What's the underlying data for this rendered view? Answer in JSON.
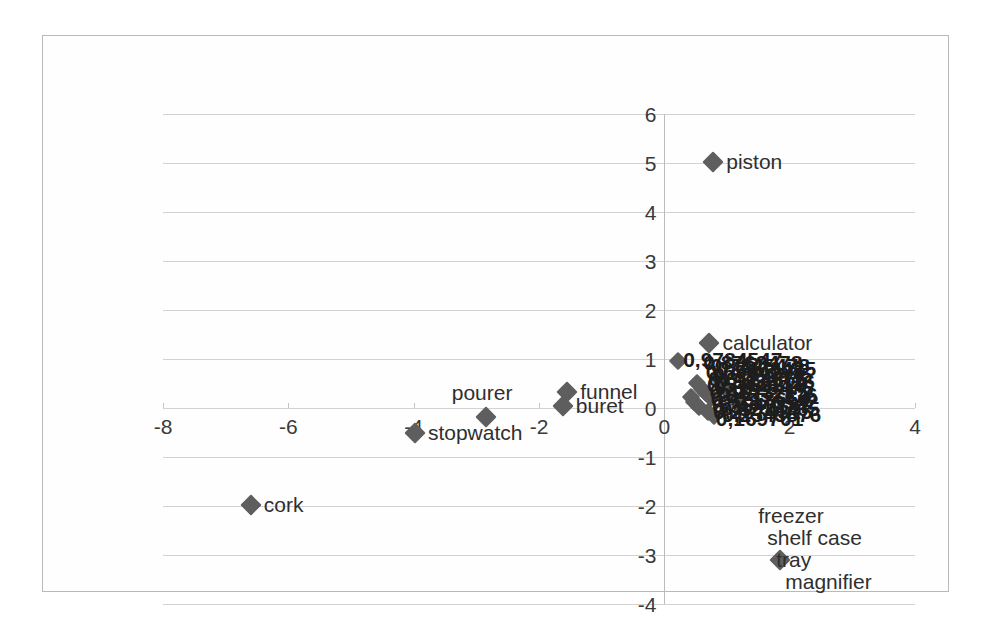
{
  "chart_data": {
    "type": "scatter",
    "title": "",
    "xlabel": "",
    "ylabel": "",
    "xlim": [
      -8,
      4
    ],
    "ylim": [
      -4,
      6
    ],
    "xticks": [
      "-8",
      "-6",
      "-4",
      "-2",
      "0",
      "2",
      "4"
    ],
    "yticks": [
      "6",
      "5",
      "4",
      "3",
      "2",
      "1",
      "0",
      "-1",
      "-2",
      "-3",
      "-4"
    ],
    "grid": "horizontal",
    "legend": "none",
    "marker": "diamond",
    "marker_color": "#5e5e5e",
    "decimal_separator": ",",
    "points": [
      {
        "label": "piston",
        "x": 0.78,
        "y": 5.02,
        "label_pos": "right"
      },
      {
        "label": "calculator",
        "x": 0.72,
        "y": 1.32,
        "label_pos": "right"
      },
      {
        "label": "cork",
        "x": -6.6,
        "y": -1.98,
        "label_pos": "right"
      },
      {
        "label": "stopwatch",
        "x": -3.98,
        "y": -0.52,
        "label_pos": "right"
      },
      {
        "label": "pourer",
        "x": -2.85,
        "y": -0.18,
        "label_pos": "above"
      },
      {
        "label": "funnel",
        "x": -1.55,
        "y": 0.33,
        "label_pos": "right"
      },
      {
        "label": "buret",
        "x": -1.62,
        "y": 0.04,
        "label_pos": "right"
      },
      {
        "label": "freezer",
        "x": 1.85,
        "y": -3.1,
        "label_pos": "stack-0"
      },
      {
        "label": "shelf case",
        "x": 1.85,
        "y": -3.1,
        "label_pos": "stack-1"
      },
      {
        "label": "tray",
        "x": 1.85,
        "y": -3.1,
        "label_pos": "stack-2"
      },
      {
        "label": "magnifier",
        "x": 1.85,
        "y": -3.1,
        "label_pos": "stack-3"
      }
    ],
    "cluster_note": "Dense overlapping cluster of numeric data labels near the origin (x 0.2-2.2, y -0.3 to 1.1); most values are illegible where the text overlaps.",
    "cluster_markers": [
      {
        "x": 0.22,
        "y": 0.96
      },
      {
        "x": 0.52,
        "y": 0.52
      },
      {
        "x": 0.6,
        "y": 0.38
      },
      {
        "x": 0.42,
        "y": 0.22
      },
      {
        "x": 0.48,
        "y": 0.12
      },
      {
        "x": 0.66,
        "y": 0.3
      },
      {
        "x": 0.74,
        "y": 0.2
      },
      {
        "x": 0.56,
        "y": 0.02
      },
      {
        "x": 0.7,
        "y": -0.08
      },
      {
        "x": 0.8,
        "y": -0.16
      },
      {
        "x": 0.92,
        "y": 0.46
      },
      {
        "x": 1.02,
        "y": 0.34
      },
      {
        "x": 1.12,
        "y": 0.18
      },
      {
        "x": 1.2,
        "y": 0.06
      },
      {
        "x": 0.86,
        "y": 0.62
      }
    ],
    "cluster_labels": [
      {
        "text": "0,9784547",
        "x": 0.3,
        "y": 0.98
      },
      {
        "text": "0,8763478",
        "x": 0.62,
        "y": 0.92
      },
      {
        "text": "0,7845478",
        "x": 0.74,
        "y": 0.86
      },
      {
        "text": "0,7463425",
        "x": 0.84,
        "y": 0.8
      },
      {
        "text": "0,6984275",
        "x": 0.66,
        "y": 0.74
      },
      {
        "text": "0,6532845",
        "x": 0.78,
        "y": 0.68
      },
      {
        "text": "0,6124365",
        "x": 0.7,
        "y": 0.6
      },
      {
        "text": "0,5874326",
        "x": 0.82,
        "y": 0.54
      },
      {
        "text": "0,5463218",
        "x": 0.68,
        "y": 0.46
      },
      {
        "text": "0,5123476",
        "x": 0.8,
        "y": 0.4
      },
      {
        "text": "0,4873215",
        "x": 0.72,
        "y": 0.32
      },
      {
        "text": "0,4532176",
        "x": 0.86,
        "y": 0.26
      },
      {
        "text": "0,4213654",
        "x": 0.74,
        "y": 0.18
      },
      {
        "text": "0,3876542",
        "x": 0.88,
        "y": 0.12
      },
      {
        "text": "0,3542187",
        "x": 0.76,
        "y": 0.04
      },
      {
        "text": "0,3214765",
        "x": 0.9,
        "y": -0.02
      },
      {
        "text": "0,2874315",
        "x": 0.78,
        "y": -0.08
      },
      {
        "text": "0,2543876",
        "x": 0.92,
        "y": -0.14
      },
      {
        "text": "0,169701",
        "x": 0.82,
        "y": -0.22
      }
    ]
  }
}
